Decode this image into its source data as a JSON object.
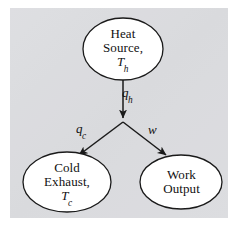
{
  "figure": {
    "type": "flow-diagram",
    "panel_color": "#d9dadd",
    "stroke_color": "#1a1a1a",
    "node_fill": "#ffffff"
  },
  "nodes": [
    {
      "id": "heat-source",
      "shape": "ellipse",
      "lines": [
        "Heat",
        "Source,"
      ],
      "symbol": "T",
      "subscript": "h",
      "cx": 123,
      "cy": 49,
      "rx": 40,
      "ry": 31
    },
    {
      "id": "cold-exhaust",
      "shape": "ellipse",
      "lines": [
        "Cold",
        "Exhaust,"
      ],
      "symbol": "T",
      "subscript": "c",
      "cx": 67,
      "cy": 182,
      "rx": 44,
      "ry": 30
    },
    {
      "id": "work-output",
      "shape": "ellipse",
      "lines": [
        "Work",
        "Output"
      ],
      "symbol": "",
      "subscript": "",
      "cx": 181,
      "cy": 182,
      "rx": 41,
      "ry": 27
    }
  ],
  "edges": [
    {
      "id": "qh",
      "from": "heat-source",
      "to": "junction",
      "symbol": "q",
      "subscript": "h",
      "direction": "down"
    },
    {
      "id": "qc",
      "from": "junction",
      "to": "cold-exhaust",
      "symbol": "q",
      "subscript": "c",
      "direction": "down-left"
    },
    {
      "id": "w",
      "from": "junction",
      "to": "work-output",
      "symbol": "w",
      "subscript": "",
      "direction": "down-right"
    }
  ],
  "labels": {
    "heat_source_line1": "Heat",
    "heat_source_line2": "Source,",
    "heat_source_symbol": "T",
    "heat_source_subscript": "h",
    "cold_exhaust_line1": "Cold",
    "cold_exhaust_line2": "Exhaust,",
    "cold_exhaust_symbol": "T",
    "cold_exhaust_subscript": "c",
    "work_output_line1": "Work",
    "work_output_line2": "Output",
    "qh_symbol": "q",
    "qh_subscript": "h",
    "qc_symbol": "q",
    "qc_subscript": "c",
    "w_symbol": "w"
  }
}
